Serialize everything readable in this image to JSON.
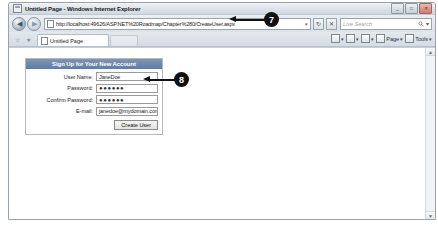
{
  "window": {
    "title": "Untitled Page - Windows Internet Explorer",
    "title_icon": "page-icon",
    "minimize_label": "_",
    "maximize_label": "□",
    "close_label": "✕"
  },
  "navbar": {
    "back_label": "◀",
    "forward_label": "▶",
    "address_icon": "page-icon",
    "url": "http://localhost:49626/ASP.NET%20Roadmap/Chapter%280/CreateUser.aspx",
    "address_dropdown": "▾",
    "refresh_label": "↻",
    "stop_label": "✕",
    "search_placeholder": "Live Search",
    "search_icon": "magnifier-icon",
    "search_dropdown": "▾"
  },
  "tabbar": {
    "favorites_add_icon": "☆",
    "favorites_center_icon": "★",
    "tab_label": "Untitled Page",
    "commands": [
      {
        "name": "home",
        "glyph": "⌂",
        "label": "",
        "caret": "▾"
      },
      {
        "name": "feeds",
        "glyph": "▣",
        "label": "",
        "caret": "▾"
      },
      {
        "name": "print",
        "glyph": "⎙",
        "label": "",
        "caret": "▾"
      },
      {
        "name": "page",
        "glyph": "▤",
        "label": "Page",
        "caret": "▾"
      },
      {
        "name": "tools",
        "glyph": "⚙",
        "label": "Tools",
        "caret": "▾"
      }
    ]
  },
  "content": {
    "scroll_up": "▲",
    "scroll_down": "▼"
  },
  "form": {
    "header": "Sign Up for Your New Account",
    "fields": [
      {
        "label": "User Name:",
        "value": "JaneDoe",
        "type": "text",
        "name": "user-name"
      },
      {
        "label": "Password:",
        "value": "●●●●●●",
        "type": "password",
        "name": "password"
      },
      {
        "label": "Confirm Password:",
        "value": "●●●●●●",
        "type": "password",
        "name": "confirm-password"
      },
      {
        "label": "E-mail:",
        "value": "janedoe@mydomain.com",
        "type": "text",
        "name": "email"
      }
    ],
    "submit_label": "Create User"
  },
  "callouts": [
    {
      "number": "7",
      "target": "address-bar"
    },
    {
      "number": "8",
      "target": "createuser-form"
    }
  ]
}
